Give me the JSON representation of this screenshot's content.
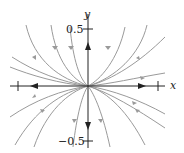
{
  "figure": {
    "type": "phase_portrait",
    "axes": {
      "x_label": "x",
      "y_label": "y",
      "y_ticks": [
        {
          "value": 0.5,
          "label": "0.5"
        },
        {
          "value": -0.5,
          "label": "−0.5"
        }
      ],
      "x_ticks_unlabeled": 2
    },
    "colors": {
      "trajectory": "#9a9a9a",
      "axis": "#222222"
    }
  }
}
